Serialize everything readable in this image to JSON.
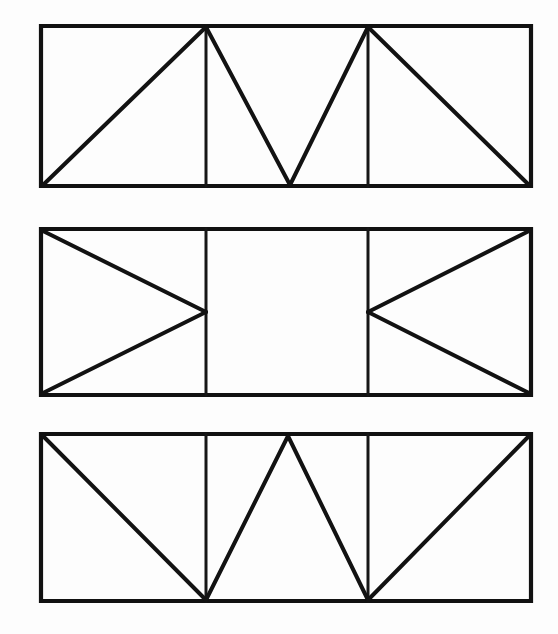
{
  "document": {
    "title": "Truss Pattern Figures",
    "background_color": "#fdfdfd",
    "ink_color": "#111111",
    "canvas_width": 558,
    "canvas_height": 634,
    "figure_count": 3,
    "description": "Three stacked horizontal rectangles, each subdivided by two vertical lines into three equal bays, with different diagonal bracing patterns drawn in heavy black ink."
  },
  "figures": [
    {
      "id": "figure-1",
      "name": "zigzag-truss-panel",
      "label": "Panel 1",
      "pattern": "M-zigzag bracing: diagonals rise from bottom-left to the first divider top, fall to the mid-span bottom, rise to the second divider top, then fall to the bottom-right corner.",
      "frame": {
        "x": 41,
        "y": 26,
        "width": 490,
        "height": 160
      },
      "frame_path": "M 41 26 L 531 26 L 531 186 L 41 186 Z",
      "dividers": [
        {
          "name": "divider-left",
          "path": "M 206 26 L 206 186",
          "x": 206
        },
        {
          "name": "divider-right",
          "path": "M 368 26 L 368 186",
          "x": 368
        }
      ],
      "diagonals": [
        {
          "name": "diagonal-1",
          "path": "M 43 185 L 206 27"
        },
        {
          "name": "diagonal-2",
          "path": "M 206 27 L 290 185"
        },
        {
          "name": "diagonal-3",
          "path": "M 290 185 L 368 27"
        },
        {
          "name": "diagonal-4",
          "path": "M 368 27 L 529 185"
        }
      ],
      "vertices": {
        "apex_points": [
          {
            "x": 206,
            "y": 26
          },
          {
            "x": 368,
            "y": 26
          }
        ],
        "valley_points": [
          {
            "x": 290,
            "y": 186
          }
        ]
      }
    },
    {
      "id": "figure-2",
      "name": "opposing-arrow-panel",
      "label": "Panel 2",
      "pattern": "Two opposing triangles: the left bay holds a triangle pointing right whose apex meets the left divider at mid-height; the right bay holds a mirrored triangle pointing left whose apex meets the right divider at mid-height. The centre bay is empty.",
      "frame": {
        "x": 41,
        "y": 229,
        "width": 490,
        "height": 166
      },
      "frame_path": "M 41 229 L 531 229 L 531 395 L 41 395 Z",
      "dividers": [
        {
          "name": "divider-left",
          "path": "M 206 229 L 206 395",
          "x": 206
        },
        {
          "name": "divider-right",
          "path": "M 368 229 L 368 395",
          "x": 368
        }
      ],
      "diagonals": [
        {
          "name": "diagonal-1",
          "path": "M 43 231 L 206 312"
        },
        {
          "name": "diagonal-2",
          "path": "M 206 312 L 43 393"
        },
        {
          "name": "diagonal-3",
          "path": "M 529 231 L 368 312"
        },
        {
          "name": "diagonal-4",
          "path": "M 368 312 L 529 393"
        }
      ],
      "vertices": {
        "apex_points": [
          {
            "x": 206,
            "y": 312
          },
          {
            "x": 368,
            "y": 312
          }
        ],
        "valley_points": []
      }
    },
    {
      "id": "figure-3",
      "name": "w-truss-panel",
      "label": "Panel 3",
      "pattern": "W bracing: diagonals fall from the top-left corner to the first divider bottom, rise to a mid-span top peak, fall to the second divider bottom, then rise to the top-right corner.",
      "frame": {
        "x": 41,
        "y": 434,
        "width": 490,
        "height": 167
      },
      "frame_path": "M 41 434 L 531 434 L 531 601 L 41 601 Z",
      "dividers": [
        {
          "name": "divider-left",
          "path": "M 206 434 L 206 601",
          "x": 206
        },
        {
          "name": "divider-right",
          "path": "M 368 434 L 368 601",
          "x": 368
        }
      ],
      "diagonals": [
        {
          "name": "diagonal-1",
          "path": "M 43 436 L 206 600"
        },
        {
          "name": "diagonal-2",
          "path": "M 206 600 L 288 436"
        },
        {
          "name": "diagonal-3",
          "path": "M 288 436 L 368 600"
        },
        {
          "name": "diagonal-4",
          "path": "M 368 600 L 529 436"
        }
      ],
      "vertices": {
        "apex_points": [
          {
            "x": 288,
            "y": 434
          }
        ],
        "valley_points": [
          {
            "x": 206,
            "y": 601
          },
          {
            "x": 368,
            "y": 601
          }
        ]
      }
    }
  ]
}
